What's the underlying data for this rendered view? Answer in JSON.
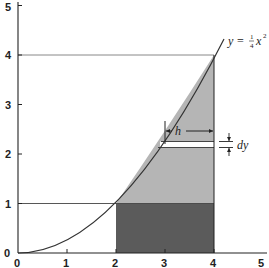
{
  "figure": {
    "type": "diagram",
    "equation": {
      "lhs": "y",
      "eq": "=",
      "frac_num": "1",
      "frac_den": "4",
      "var": "x",
      "exp": "2"
    },
    "annotations": {
      "h_label": "h",
      "dy_label": "dy"
    },
    "x_axis": {
      "ticks": [
        "0",
        "1",
        "2",
        "3",
        "4",
        "5"
      ],
      "range": [
        0,
        5
      ]
    },
    "y_axis": {
      "ticks": [
        "0",
        "1",
        "2",
        "3",
        "4",
        "5"
      ],
      "range": [
        0,
        5
      ]
    },
    "regions": [
      {
        "name": "dark-rectangle",
        "x": [
          2,
          4
        ],
        "y": [
          0,
          1
        ],
        "color": "#5a5a5a"
      },
      {
        "name": "light-region",
        "bounds": "y=x^2/4 to x=4, y from 1 to 4",
        "color": "#b4b4b4"
      },
      {
        "name": "strip",
        "y": 2.2,
        "thickness": "dy",
        "color": "#ffffff"
      }
    ],
    "guide_lines": [
      {
        "name": "horizontal-y4",
        "y": 4
      },
      {
        "name": "horizontal-y1",
        "y": 1
      }
    ]
  }
}
